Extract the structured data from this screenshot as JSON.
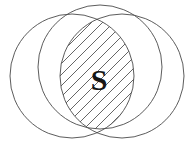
{
  "figure": {
    "name": "venn-diagram-three-circles",
    "background_color": "#ffffff",
    "stroke_color": "#4a4a4a",
    "label_color": "#161616",
    "width": 195,
    "height": 154
  },
  "chart_data": {
    "type": "diagram",
    "diagram_type": "venn",
    "title": "",
    "set_count": 3,
    "circles": [
      {
        "id": "top",
        "name": "top-circle",
        "cx": 100,
        "cy": 67,
        "r": 62,
        "label": ""
      },
      {
        "id": "left",
        "name": "left-circle",
        "cx": 72,
        "cy": 76,
        "r": 62,
        "label": ""
      },
      {
        "id": "right",
        "name": "right-circle",
        "cx": 122,
        "cy": 76,
        "r": 62,
        "label": ""
      }
    ],
    "shaded_regions": [
      {
        "id": "triple-intersection",
        "label": "S",
        "sets": [
          "top",
          "left",
          "right"
        ],
        "fill_pattern": "diagonal-hatch",
        "hatch_angle_degrees": 45,
        "hatch_spacing": 8,
        "label_x": 99,
        "label_y": 78
      }
    ],
    "legend": [],
    "annotations": [
      {
        "text": "S",
        "x": 99,
        "y": 78
      }
    ]
  },
  "labels": {
    "shaded_region_label": "S"
  }
}
